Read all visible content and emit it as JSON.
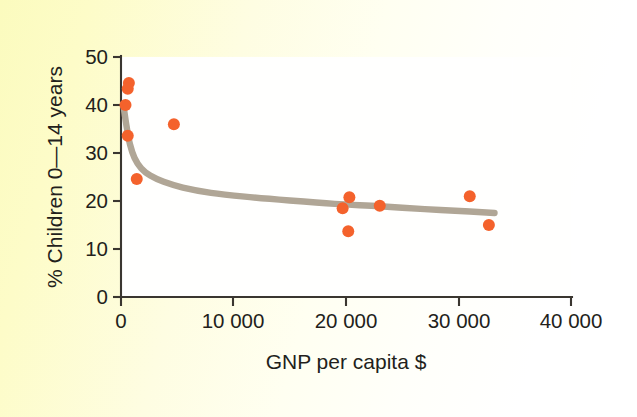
{
  "figure": {
    "background_left": "#fbfbbe",
    "background_right": "#ffffff",
    "plot_background": "#ffffff"
  },
  "chart_data": {
    "type": "scatter",
    "title": "",
    "subtitle": "",
    "xlabel": "GNP per capita $",
    "ylabel": "% Children 0—14 years",
    "xlim": [
      0,
      40000
    ],
    "ylim": [
      0,
      50
    ],
    "grid": false,
    "legend": null,
    "x_ticks": [
      0,
      10000,
      20000,
      30000,
      40000
    ],
    "x_tick_labels": [
      "0",
      "10 000",
      "20 000",
      "30 000",
      "40 000"
    ],
    "y_ticks": [
      0,
      10,
      20,
      30,
      40,
      50
    ],
    "y_tick_labels": [
      "0",
      "10",
      "20",
      "30",
      "40",
      "50"
    ],
    "point_color": "#f4622c",
    "point_radius_px": 6,
    "trend_color": "#b0a696",
    "trend_label": "fitted decreasing curve",
    "points": [
      {
        "x": 700,
        "y": 44.6
      },
      {
        "x": 600,
        "y": 43.4
      },
      {
        "x": 400,
        "y": 40.0
      },
      {
        "x": 600,
        "y": 33.6
      },
      {
        "x": 1400,
        "y": 24.6
      },
      {
        "x": 4700,
        "y": 36.0
      },
      {
        "x": 19700,
        "y": 18.5
      },
      {
        "x": 20300,
        "y": 20.8
      },
      {
        "x": 20200,
        "y": 13.7
      },
      {
        "x": 23000,
        "y": 19.0
      },
      {
        "x": 31000,
        "y": 21.0
      },
      {
        "x": 32700,
        "y": 15.0
      }
    ],
    "trend_curve": [
      {
        "x": 200,
        "y": 40.2
      },
      {
        "x": 500,
        "y": 35.5
      },
      {
        "x": 800,
        "y": 31.8
      },
      {
        "x": 1200,
        "y": 29.0
      },
      {
        "x": 1800,
        "y": 26.8
      },
      {
        "x": 2600,
        "y": 25.3
      },
      {
        "x": 3800,
        "y": 24.0
      },
      {
        "x": 5500,
        "y": 22.8
      },
      {
        "x": 8000,
        "y": 21.7
      },
      {
        "x": 11000,
        "y": 20.9
      },
      {
        "x": 15000,
        "y": 20.1
      },
      {
        "x": 19000,
        "y": 19.4
      },
      {
        "x": 23000,
        "y": 18.9
      },
      {
        "x": 27000,
        "y": 18.3
      },
      {
        "x": 31000,
        "y": 17.8
      },
      {
        "x": 33200,
        "y": 17.5
      }
    ]
  }
}
